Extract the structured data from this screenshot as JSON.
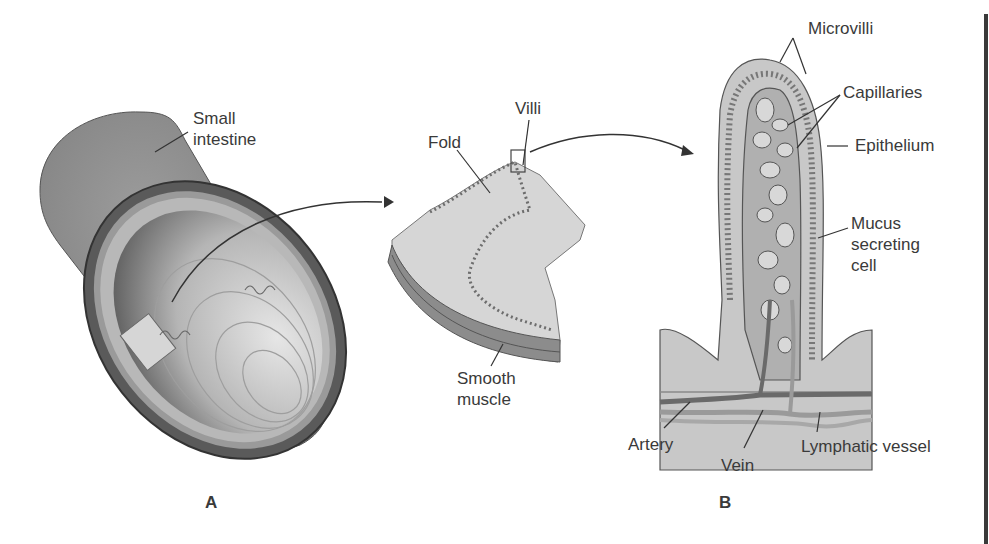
{
  "figure": {
    "panels": [
      {
        "id": "A",
        "label": "A"
      },
      {
        "id": "B",
        "label": "B"
      }
    ],
    "labels": {
      "small_intestine": "Small\nintestine",
      "fold": "Fold",
      "villi": "Villi",
      "smooth_muscle": "Smooth\nmuscle",
      "microvilli": "Microvilli",
      "capillaries": "Capillaries",
      "epithelium": "Epithelium",
      "mucus_secreting_cell": "Mucus\nsecreting\ncell",
      "artery": "Artery",
      "vein": "Vein",
      "lymphatic_vessel": "Lymphatic vessel"
    },
    "colors": {
      "tube_outer": "#8a8a8a",
      "tube_inner": "#6e6e6e",
      "lumen_light": "#cfcfcf",
      "tissue_light": "#d4d4d4",
      "muscle_dark": "#7a7a7a",
      "outline": "#444444",
      "text": "#3a3a3a"
    }
  }
}
